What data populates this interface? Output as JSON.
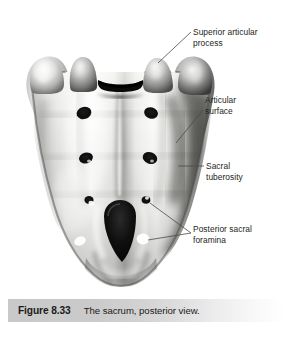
{
  "figure": {
    "number_label": "Figure 8.33",
    "caption": "The sacrum, posterior view.",
    "subject": "sacrum",
    "view": "posterior"
  },
  "labels": {
    "superior_articular_process": "Superior articular\nprocess",
    "superior_articular_process_line1": "Superior articular",
    "superior_articular_process_line2": "process",
    "articular_surface_line1": "Articular",
    "articular_surface_line2": "surface",
    "sacral_tuberosity_line1": "Sacral",
    "sacral_tuberosity_line2": "tuberosity",
    "posterior_sacral_foramina_line1": "Posterior sacral",
    "posterior_sacral_foramina_line2": "foramina"
  },
  "colors": {
    "text": "#231f20",
    "leader_line": "#4a4a4a",
    "caption_bar_start": "#c9c9c9",
    "caption_bar_end": "#ffffff",
    "background": "#ffffff",
    "bone_light": "#f2f2f0",
    "bone_mid": "#b8b8b6",
    "bone_shadow": "#4a4a48",
    "bone_dark": "#151515"
  }
}
